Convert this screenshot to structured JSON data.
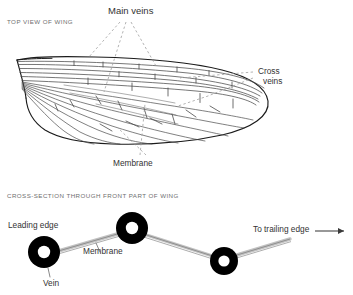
{
  "figure": {
    "title_top": "TOP VIEW OF WING",
    "title_bottom": "CROSS-SECTION THROUGH FRONT PART OF WING",
    "colors": {
      "ink": "#333333",
      "caption": "#6f6f6f",
      "outline": "#1b1b1b",
      "vein_line": "#555555",
      "leader": "#9a9a9a",
      "membrane_fill": "#c9c9c9",
      "vein_solid": "#000000",
      "background": "#ffffff"
    }
  },
  "top_view": {
    "label_main_veins": "Main veins",
    "label_cross_veins_line1": "Cross",
    "label_cross_veins_line2": "veins",
    "label_membrane": "Membrane",
    "leaders": {
      "main_veins_count": 3,
      "cross_veins_count": 2,
      "membrane_count": 2
    }
  },
  "cross_section": {
    "label_leading_edge": "Leading edge",
    "label_membrane": "Membrane",
    "label_vein": "Vein",
    "label_to_trailing_edge": "To trailing edge",
    "arrow_icon": "right-arrow-icon",
    "vein_count": 3
  }
}
